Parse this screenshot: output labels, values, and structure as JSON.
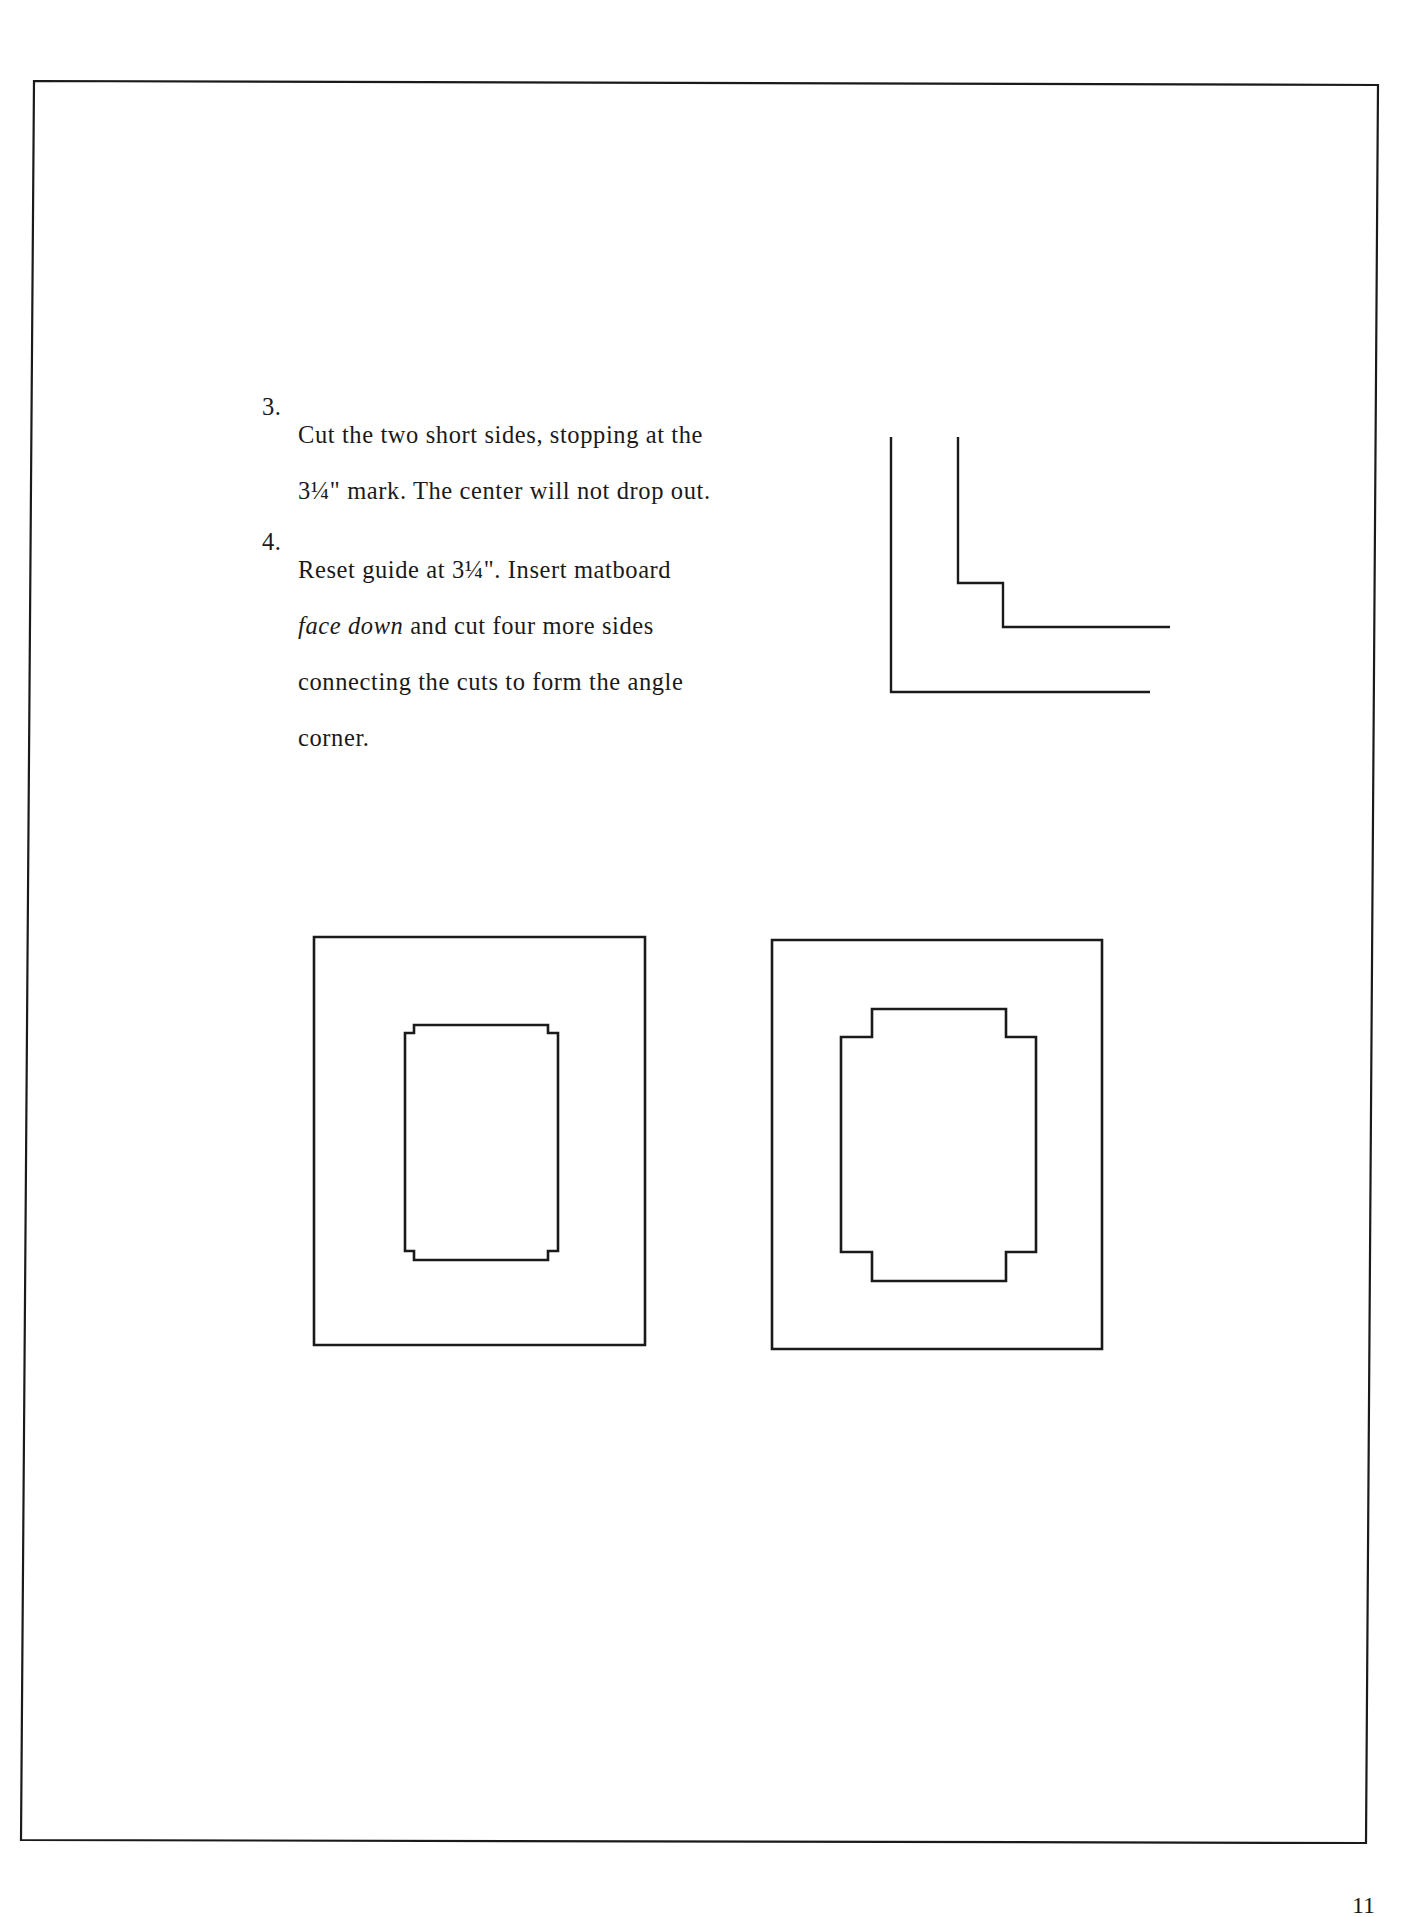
{
  "page": {
    "background": "#ffffff",
    "ink": "#1a1a1a"
  },
  "instructions": [
    {
      "number": "3.",
      "lines": [
        "Cut the two short sides, stopping at  the",
        "3¼\" mark.  The center will not drop out."
      ]
    },
    {
      "number": "4.",
      "line1": "Reset guide at 3¼\".  Insert matboard",
      "line2_italic": "face down",
      "line2_rest": " and cut four more sides",
      "line3": "connecting the cuts to form the angle",
      "line4": "corner."
    }
  ],
  "figures": {
    "corner_detail": "L-shaped corner diagram showing stepped inner cut",
    "mat_small_notch": "Mat with small notched corners",
    "mat_large_notch": "Mat with large notched corners"
  },
  "page_number": "11"
}
